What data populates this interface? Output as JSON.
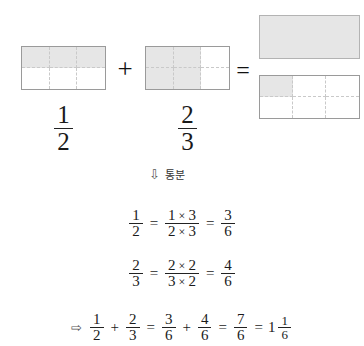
{
  "diagram": {
    "models": [
      {
        "name": "first-addend-model",
        "columns": 3,
        "rows": 2,
        "shaded_cells": 3,
        "shaded_pattern": "top-row",
        "fraction": {
          "numerator": "1",
          "denominator": "2"
        }
      },
      {
        "name": "second-addend-model",
        "columns": 3,
        "rows": 2,
        "shaded_cells": 4,
        "shaded_pattern": "left-two-columns",
        "fraction": {
          "numerator": "2",
          "denominator": "3"
        }
      },
      {
        "name": "result-whole-model",
        "columns": 1,
        "rows": 1,
        "shaded_cells": 1,
        "shaded_pattern": "full",
        "fraction": {
          "numerator": "1",
          "denominator": "1"
        }
      },
      {
        "name": "result-remainder-model",
        "columns": 3,
        "rows": 2,
        "shaded_cells": 1,
        "shaded_pattern": "top-left-cell",
        "fraction": {
          "numerator": "1",
          "denominator": "6"
        }
      }
    ],
    "operators": {
      "plus": "+",
      "equals": "="
    },
    "annotation": {
      "arrow": "⇩",
      "text": "통분"
    },
    "equations": [
      {
        "name": "convert-first-fraction",
        "left": {
          "numerator": "1",
          "denominator": "2"
        },
        "equals_1": "=",
        "middle": {
          "num_a": "1",
          "times": "×",
          "num_b": "3",
          "den_a": "2",
          "den_b": "3"
        },
        "equals_2": "=",
        "right": {
          "numerator": "3",
          "denominator": "6"
        }
      },
      {
        "name": "convert-second-fraction",
        "left": {
          "numerator": "2",
          "denominator": "3"
        },
        "equals_1": "=",
        "middle": {
          "num_a": "2",
          "times": "×",
          "num_b": "2",
          "den_a": "3",
          "den_b": "2"
        },
        "equals_2": "=",
        "right": {
          "numerator": "4",
          "denominator": "6"
        }
      }
    ],
    "final_equation": {
      "name": "final-sum",
      "arrow": "⇨",
      "term_1": {
        "numerator": "1",
        "denominator": "2"
      },
      "plus_1": "+",
      "term_2": {
        "numerator": "2",
        "denominator": "3"
      },
      "equals_1": "=",
      "term_3": {
        "numerator": "3",
        "denominator": "6"
      },
      "plus_2": "+",
      "term_4": {
        "numerator": "4",
        "denominator": "6"
      },
      "equals_2": "=",
      "term_5": {
        "numerator": "7",
        "denominator": "6"
      },
      "equals_3": "=",
      "mixed": {
        "whole": "1",
        "numerator": "1",
        "denominator": "6"
      }
    },
    "colors": {
      "shade": "#e6e6e6",
      "border": "#9a9a9a",
      "gridline": "#c9c9c9",
      "text": "#1a1a1a",
      "background": "#ffffff"
    }
  }
}
